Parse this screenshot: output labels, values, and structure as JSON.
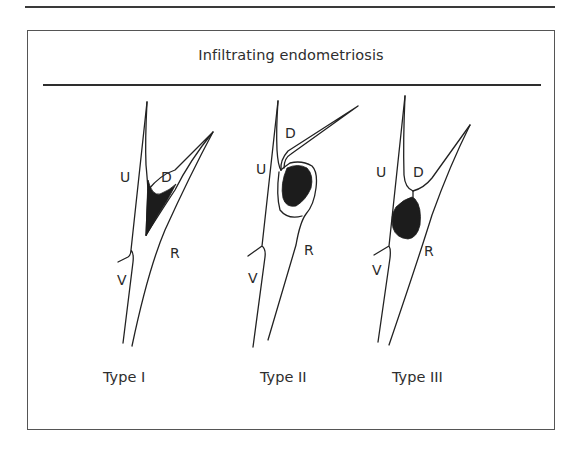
{
  "figure": {
    "title": "Infiltrating endometriosis",
    "panels": [
      {
        "id": "type-1",
        "caption": "Type I",
        "labels": {
          "uterus": "U",
          "douglas": "D",
          "rectum": "R",
          "vagina": "V"
        },
        "lesion": "wedge-shaped lesion in the pouch of Douglas"
      },
      {
        "id": "type-2",
        "caption": "Type II",
        "labels": {
          "uterus": "U",
          "douglas": "D",
          "rectum": "R",
          "vagina": "V"
        },
        "lesion": "rounded lesion retracting the rectal wall"
      },
      {
        "id": "type-3",
        "caption": "Type III",
        "labels": {
          "uterus": "U",
          "douglas": "D",
          "rectum": "R",
          "vagina": "V"
        },
        "lesion": "large nodule beneath the peritoneum, below the pouch"
      }
    ]
  },
  "colors": {
    "line": "#222222",
    "lesion": "#1c1c1c",
    "background": "#ffffff"
  }
}
